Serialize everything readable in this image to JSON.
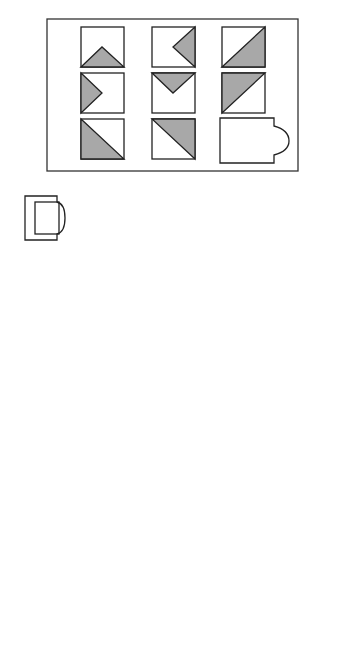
{
  "figure_a": {
    "caption": "(a)",
    "colors": {
      "stroke": "#222222",
      "fill": "#a8a8a8",
      "background": "#ffffff"
    },
    "matrix": [
      [
        "triangle-bottom",
        "triangle-right",
        "half-lower-right"
      ],
      [
        "triangle-left",
        "triangle-top",
        "half-upper-left"
      ],
      [
        "half-lower-left",
        "half-upper-right",
        "missing"
      ]
    ],
    "options": [
      {
        "label": "1",
        "pattern": "triangle-bottom"
      },
      {
        "label": "2",
        "pattern": "diamond"
      },
      {
        "label": "3",
        "pattern": "hourglass"
      },
      {
        "label": "4",
        "pattern": "half-lower-left"
      },
      {
        "label": "5",
        "pattern": "half-lower-right"
      },
      {
        "label": "6",
        "pattern": "empty"
      },
      {
        "label": "7",
        "pattern": "half-upper-left"
      },
      {
        "label": "8",
        "pattern": "full"
      }
    ]
  },
  "figure_b": {
    "caption": "(b)",
    "colors": {
      "stroke": "#222222",
      "background": "#ffffff"
    },
    "matrix": [
      [
        "1-spoke large arcs",
        "1-spoke medium arcs",
        "1-spoke small arcs"
      ],
      [
        "2-spoke large arcs",
        "2-spoke medium arcs",
        "2-spoke small arcs"
      ],
      [
        "3-spoke large arcs",
        "3-spoke medium arcs",
        "missing"
      ]
    ],
    "options": [
      {
        "label": "1",
        "pattern": "3-spoke small arcs"
      },
      {
        "label": "2",
        "pattern": "3-spoke medium arcs"
      },
      {
        "label": "3",
        "pattern": "2-spoke small arcs"
      },
      {
        "label": "4",
        "pattern": "2-spoke medium arcs"
      },
      {
        "label": "5",
        "pattern": "3-spoke large arcs"
      },
      {
        "label": "6",
        "pattern": "3-spoke multiple arcs"
      },
      {
        "label": "7",
        "pattern": "3-spoke no arcs"
      },
      {
        "label": "8",
        "pattern": "3-spoke large arcs crossing"
      }
    ]
  }
}
